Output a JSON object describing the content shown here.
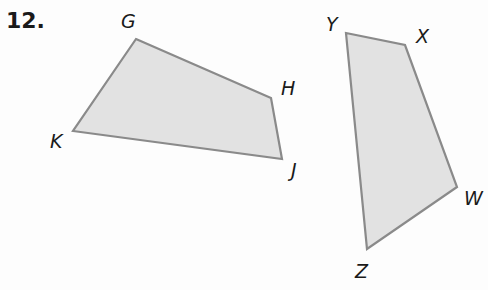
{
  "problem": {
    "number": "12."
  },
  "colors": {
    "fill": "#e2e2e2",
    "stroke": "#8a8a8a",
    "text": "#1a1a1a"
  },
  "figures": [
    {
      "name": "GHJK",
      "vertices": [
        {
          "label": "G",
          "x": 136,
          "y": 39,
          "lx": 121,
          "ly": 28
        },
        {
          "label": "H",
          "x": 271,
          "y": 98,
          "lx": 281,
          "ly": 95
        },
        {
          "label": "J",
          "x": 282,
          "y": 159,
          "lx": 291,
          "ly": 177
        },
        {
          "label": "K",
          "x": 73,
          "y": 131,
          "lx": 50,
          "ly": 148
        }
      ]
    },
    {
      "name": "YXWZ",
      "vertices": [
        {
          "label": "Y",
          "x": 346,
          "y": 33,
          "lx": 326,
          "ly": 31
        },
        {
          "label": "X",
          "x": 405,
          "y": 45,
          "lx": 416,
          "ly": 43
        },
        {
          "label": "W",
          "x": 457,
          "y": 187,
          "lx": 464,
          "ly": 205
        },
        {
          "label": "Z",
          "x": 367,
          "y": 249,
          "lx": 355,
          "ly": 278
        }
      ]
    }
  ]
}
